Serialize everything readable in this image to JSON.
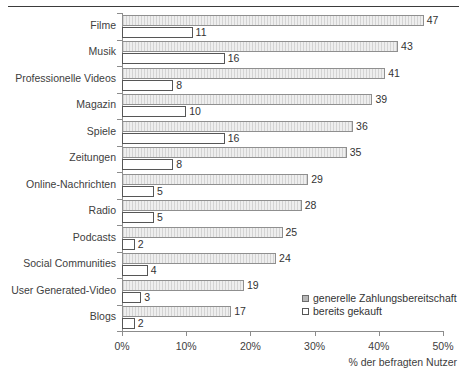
{
  "chart_data": {
    "type": "bar",
    "orientation": "horizontal",
    "title": "",
    "subtitle": "",
    "xlabel": "% der befragten Nutzer",
    "ylabel": "",
    "xlim": [
      0,
      50
    ],
    "xticks": [
      0,
      10,
      20,
      30,
      40,
      50
    ],
    "xtick_labels": [
      "0%",
      "10%",
      "20%",
      "30%",
      "40%",
      "50%"
    ],
    "grid": false,
    "legend_position": "inside-bottom-right",
    "categories": [
      "Filme",
      "Musik",
      "Professionelle Videos",
      "Magazin",
      "Spiele",
      "Zeitungen",
      "Online-Nachrichten",
      "Radio",
      "Podcasts",
      "Social Communities",
      "User Generated-Video",
      "Blogs"
    ],
    "series": [
      {
        "name": "generelle Zahlungsbereitschaft",
        "style": "gray-filled",
        "color": "#eeeeee",
        "values": [
          47,
          43,
          41,
          39,
          36,
          35,
          29,
          28,
          25,
          24,
          19,
          17
        ]
      },
      {
        "name": "bereits gekauft",
        "style": "white-outlined",
        "color": "#ffffff",
        "values": [
          11,
          16,
          8,
          10,
          16,
          8,
          5,
          5,
          2,
          4,
          3,
          2
        ]
      }
    ]
  },
  "legend": {
    "items": [
      {
        "label": "generelle Zahlungsbereitschaft"
      },
      {
        "label": "bereits gekauft"
      }
    ]
  },
  "axis": {
    "x_title": "% der befragten Nutzer"
  }
}
